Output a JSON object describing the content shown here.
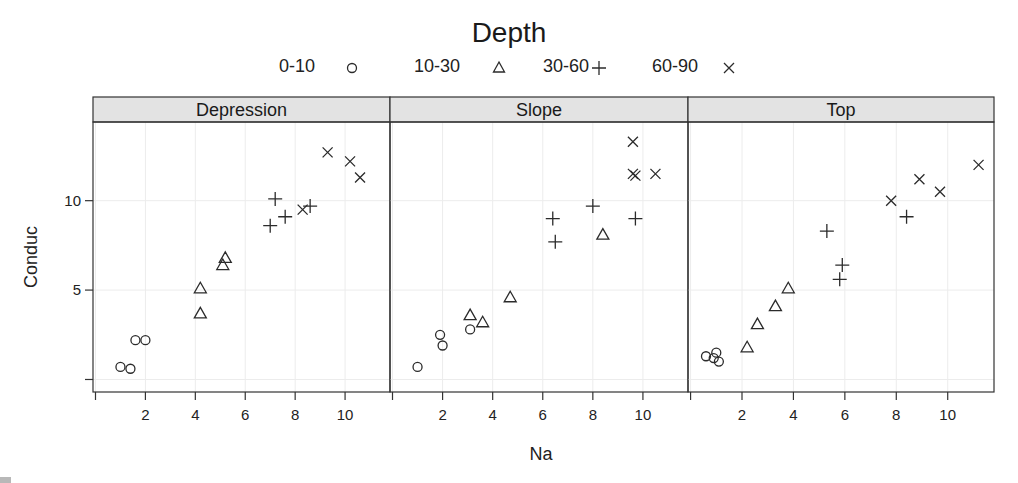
{
  "chart_data": {
    "type": "scatter",
    "title": "",
    "legend": {
      "title": "Depth",
      "position": "top",
      "entries": [
        {
          "label": "0-10",
          "symbol": "circle"
        },
        {
          "label": "10-30",
          "symbol": "triangle"
        },
        {
          "label": "30-60",
          "symbol": "plus"
        },
        {
          "label": "60-90",
          "symbol": "cross"
        }
      ]
    },
    "xlabel": "Na",
    "ylabel": "Conduc",
    "xlim": [
      -0.1,
      11.8
    ],
    "ylim": [
      -0.7,
      14.4
    ],
    "xticks": [
      0,
      2,
      4,
      6,
      8,
      10
    ],
    "xtick_labels": [
      "",
      "2",
      "4",
      "6",
      "8",
      "10"
    ],
    "yticks": [
      0,
      5,
      10
    ],
    "ytick_labels": [
      "",
      "5",
      "10"
    ],
    "grid": true,
    "panels": [
      {
        "strip": "Depression",
        "series": [
          {
            "name": "0-10",
            "symbol": "circle",
            "points": [
              [
                1.0,
                0.7
              ],
              [
                1.4,
                0.6
              ],
              [
                1.6,
                2.2
              ],
              [
                2.0,
                2.2
              ]
            ]
          },
          {
            "name": "10-30",
            "symbol": "triangle",
            "points": [
              [
                4.2,
                3.7
              ],
              [
                4.2,
                5.1
              ],
              [
                5.1,
                6.4
              ],
              [
                5.2,
                6.8
              ]
            ]
          },
          {
            "name": "30-60",
            "symbol": "plus",
            "points": [
              [
                7.0,
                8.6
              ],
              [
                7.2,
                10.1
              ],
              [
                7.6,
                9.1
              ],
              [
                8.6,
                9.7
              ]
            ]
          },
          {
            "name": "60-90",
            "symbol": "cross",
            "points": [
              [
                8.3,
                9.5
              ],
              [
                9.3,
                12.7
              ],
              [
                10.2,
                12.2
              ],
              [
                10.6,
                11.3
              ]
            ]
          }
        ]
      },
      {
        "strip": "Slope",
        "series": [
          {
            "name": "0-10",
            "symbol": "circle",
            "points": [
              [
                1.0,
                0.7
              ],
              [
                1.9,
                2.5
              ],
              [
                2.0,
                1.9
              ],
              [
                3.1,
                2.8
              ]
            ]
          },
          {
            "name": "10-30",
            "symbol": "triangle",
            "points": [
              [
                3.1,
                3.6
              ],
              [
                3.6,
                3.2
              ],
              [
                4.7,
                4.6
              ],
              [
                8.4,
                8.1
              ]
            ]
          },
          {
            "name": "30-60",
            "symbol": "plus",
            "points": [
              [
                6.4,
                9.0
              ],
              [
                6.5,
                7.7
              ],
              [
                8.0,
                9.7
              ],
              [
                9.7,
                9.0
              ]
            ]
          },
          {
            "name": "60-90",
            "symbol": "cross",
            "points": [
              [
                9.6,
                13.3
              ],
              [
                9.6,
                11.5
              ],
              [
                9.7,
                11.4
              ],
              [
                10.5,
                11.5
              ]
            ]
          }
        ]
      },
      {
        "strip": "Top",
        "series": [
          {
            "name": "0-10",
            "symbol": "circle",
            "points": [
              [
                0.6,
                1.3
              ],
              [
                1.0,
                1.5
              ],
              [
                0.9,
                1.2
              ],
              [
                1.1,
                1.0
              ]
            ]
          },
          {
            "name": "10-30",
            "symbol": "triangle",
            "points": [
              [
                2.2,
                1.8
              ],
              [
                2.6,
                3.1
              ],
              [
                3.3,
                4.1
              ],
              [
                3.8,
                5.1
              ]
            ]
          },
          {
            "name": "30-60",
            "symbol": "plus",
            "points": [
              [
                5.3,
                8.3
              ],
              [
                5.8,
                5.6
              ],
              [
                5.9,
                6.4
              ],
              [
                8.4,
                9.1
              ]
            ]
          },
          {
            "name": "60-90",
            "symbol": "cross",
            "points": [
              [
                7.8,
                10.0
              ],
              [
                8.9,
                11.2
              ],
              [
                9.7,
                10.5
              ],
              [
                11.2,
                12.0
              ]
            ]
          }
        ]
      }
    ]
  },
  "colors": {
    "strip_bg": "#e3e3e3",
    "frame": "#333333",
    "grid": "#ececec",
    "symbol": "#2b2b2b"
  }
}
